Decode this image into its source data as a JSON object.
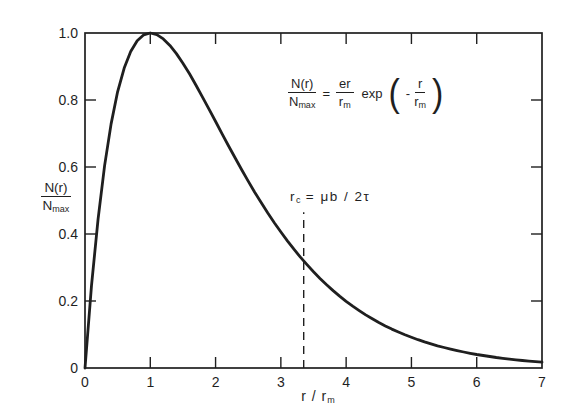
{
  "figure": {
    "background": "#ffffff",
    "ink": "#1f1f1f"
  },
  "axes": {
    "x_label": {
      "main": "r / r",
      "sub": "m"
    },
    "y_label": {
      "num": "N(r)",
      "den_base": "N",
      "den_sub": "max"
    },
    "x_tick_labels": [
      "0",
      "1",
      "2",
      "3",
      "4",
      "5",
      "6",
      "7"
    ],
    "y_tick_labels": [
      "0",
      "0.2",
      "0.4",
      "0.6",
      "0.8",
      "1.0"
    ]
  },
  "equation": {
    "lhs_num": "N(r)",
    "lhs_den_base": "N",
    "lhs_den_sub": "max",
    "equals": "=",
    "coef_num": "er",
    "coef_den_base": "r",
    "coef_den_sub": "m",
    "exp_label": "exp",
    "open_paren": "(",
    "minus": "-",
    "arg_num": "r",
    "arg_den_base": "r",
    "arg_den_sub": "m",
    "close_paren": ")"
  },
  "annotation": {
    "base": "r",
    "sub": "c",
    "rest": " = μb / 2τ"
  },
  "chart_data": {
    "type": "line",
    "title": "",
    "xlabel": "r/r_m",
    "ylabel": "N(r)/N_max",
    "xlim": [
      0,
      7
    ],
    "ylim": [
      0,
      1.0
    ],
    "x_ticks": [
      0,
      1,
      2,
      3,
      4,
      5,
      6,
      7
    ],
    "y_ticks": [
      0,
      0.2,
      0.4,
      0.6,
      0.8,
      1.0
    ],
    "inner_tick_marks": {
      "x": [
        1,
        2,
        3,
        4,
        5,
        6
      ],
      "y": [
        0.2,
        0.4,
        0.6,
        0.8
      ]
    },
    "grid": false,
    "legend": "none",
    "series": [
      {
        "name": "N(r)/Nmax = (er/rm) exp(-r/rm)",
        "formula": "y = x·e^(1-x)",
        "x_start": 0,
        "x_step": 0.1,
        "y_values": [
          0,
          0.246,
          0.4451,
          0.6041,
          0.7288,
          0.8244,
          0.8951,
          0.9449,
          0.9771,
          0.9946,
          1,
          0.9953,
          0.9825,
          0.9631,
          0.9385,
          0.9098,
          0.8781,
          0.8442,
          0.8088,
          0.7725,
          0.7358,
          0.699,
          0.6626,
          0.6268,
          0.5918,
          0.5578,
          0.5249,
          0.4933,
          0.4628,
          0.4337,
          0.406,
          0.3796,
          0.3546,
          0.3308,
          0.3084,
          0.2873,
          0.2674,
          0.2487,
          0.2311,
          0.2146,
          0.1991,
          0.1847,
          0.1712,
          0.1586,
          0.1468,
          0.1359,
          0.1257,
          0.1162,
          0.1074,
          0.0992,
          0.0916,
          0.0845,
          0.078,
          0.0719,
          0.0663,
          0.0611,
          0.0563,
          0.0518,
          0.0477,
          0.0439,
          0.0404,
          0.0372,
          0.0342,
          0.0314,
          0.0289,
          0.0266,
          0.0244,
          0.0224,
          0.0206,
          0.0189,
          0.0174
        ]
      }
    ],
    "annotations": [
      {
        "type": "dashed-vline",
        "label": "r_c = μb/2τ",
        "x": 3.35,
        "y_from": 0,
        "y_to": 0.465
      },
      {
        "type": "equation",
        "text": "N(r)/N_max = (er/r_m) exp(-r/r_m)"
      }
    ]
  }
}
